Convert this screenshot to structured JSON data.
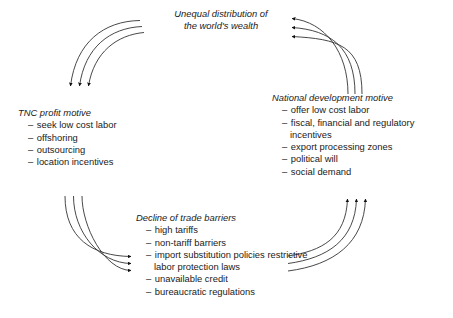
{
  "diagram": {
    "type": "cycle-diagram",
    "line_color": "#333333",
    "text_color": "#1a1a1a",
    "background": "#ffffff",
    "nodes": [
      {
        "id": "wealth",
        "title": "Unequal distribution of the world's wealth",
        "title_line1": "Unequal distribution of",
        "title_line2": "the world's wealth",
        "items": []
      },
      {
        "id": "tnc",
        "title": "TNC profit motive",
        "items": [
          "seek low cost labor",
          "offshoring",
          "outsourcing",
          "location incentives"
        ]
      },
      {
        "id": "national",
        "title": "National development motive",
        "items": [
          "offer low cost labor",
          "fiscal, financial and regulatory incentives",
          "export processing zones",
          "political will",
          "social demand"
        ]
      },
      {
        "id": "trade",
        "title": "Decline of trade barriers",
        "items": [
          "high tariffs",
          "non-tariff barriers",
          "import substitution policies restrictive labor protection laws",
          "unavailable credit",
          "bureaucratic regulations"
        ]
      }
    ],
    "edges": [
      {
        "id": "wealth-to-tnc",
        "from": "wealth",
        "to": "tnc",
        "arrow": "down",
        "strands": 3
      },
      {
        "id": "national-to-wealth",
        "from": "national",
        "to": "wealth",
        "arrow": "left",
        "strands": 3
      },
      {
        "id": "trade-to-national",
        "from": "trade",
        "to": "national",
        "arrow": "up",
        "strands": 3
      },
      {
        "id": "tnc-to-trade",
        "from": "tnc",
        "to": "trade",
        "arrow": "right",
        "strands": 3
      }
    ],
    "bullet_dash": "–"
  }
}
